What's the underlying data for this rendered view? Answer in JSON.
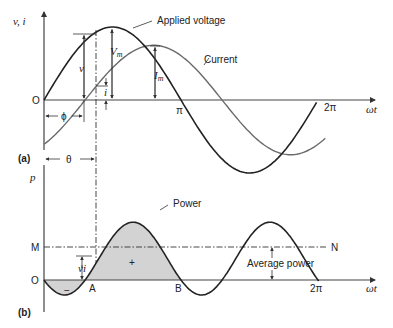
{
  "diagram": {
    "panel_a": {
      "tag": "(a)",
      "y_axis_label": "v, i",
      "x_axis_label": "ωt",
      "origin_label": "O",
      "tick_pi": "π",
      "tick_2pi": "2π",
      "voltage_label": "Applied voltage",
      "current_label": "Current",
      "vm_label": "Vm",
      "vm_main": "V",
      "vm_sub": "m",
      "im_main": "I",
      "im_sub": "m",
      "v_label": "v",
      "i_label": "i",
      "phi_label": "ϕ",
      "theta_label": "θ",
      "voltage_amplitude": 1.0,
      "current_amplitude": 0.75,
      "phase_lag_fraction_of_pi": 0.3
    },
    "panel_b": {
      "tag": "(b)",
      "y_axis_label": "p",
      "x_axis_label": "ωt",
      "origin_label": "O",
      "mean_label": "M",
      "mean_end_label": "N",
      "point_a_label": "A",
      "point_b_label": "B",
      "tick_2pi": "2π",
      "power_label": "Power",
      "average_power_label": "Average power",
      "vi_label": "vi",
      "positive_sign": "+",
      "negative_sign": "−"
    },
    "colors": {
      "voltage": "#222222",
      "current": "#6a6a6a",
      "power": "#222222",
      "fill": "#d3d3d3"
    }
  }
}
